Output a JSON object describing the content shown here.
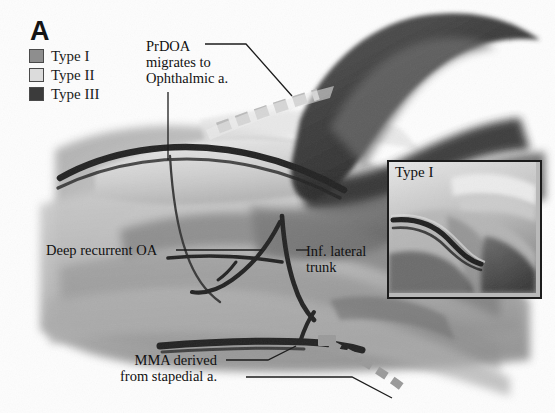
{
  "figure": {
    "panel_label": "A",
    "background_color": "#fdfdfd"
  },
  "legend": {
    "items": [
      {
        "label": "Type I",
        "swatch_color": "#8e8e8e",
        "name": "type-1"
      },
      {
        "label": "Type II",
        "swatch_color": "#dcdcdc",
        "name": "type-2"
      },
      {
        "label": "Type III",
        "swatch_color": "#3b3b3b",
        "name": "type-3"
      }
    ]
  },
  "annotations": {
    "prdoa": "PrDOA\nmigrates to\nOphthalmic a.",
    "deep_recurrent": "Deep recurrent OA",
    "inf_lateral": "Inf. lateral\ntrunk",
    "mma": "MMA derived\nfrom stapedial a."
  },
  "inset": {
    "label": "Type I"
  },
  "colors": {
    "vessel_dark": "#232323",
    "vessel_mid": "#6d6d6d",
    "dashed_light": "#d2d2d2",
    "dashed_mid": "#9a9a9a",
    "leader_line": "#1d1d1d",
    "tissue_light": "#d6d6d6",
    "tissue_mid": "#a4a4a4",
    "tissue_dark": "#5a5a5a",
    "tissue_darkest": "#3a3a3a"
  }
}
